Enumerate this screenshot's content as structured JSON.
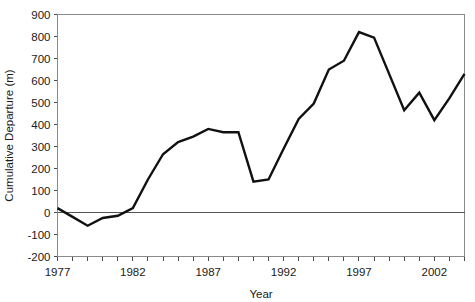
{
  "chart_data": {
    "type": "line",
    "title": "",
    "xlabel": "Year",
    "ylabel": "Cumulative Departure (m)",
    "xlim": [
      1977,
      2004
    ],
    "ylim": [
      -200,
      900
    ],
    "ytick_labels": [
      "900",
      "800",
      "700",
      "600",
      "500",
      "400",
      "300",
      "200",
      "100",
      "0",
      "-100",
      "-200"
    ],
    "ytick_values": [
      900,
      800,
      700,
      600,
      500,
      400,
      300,
      200,
      100,
      0,
      -100,
      -200
    ],
    "xtick_labels": [
      "1977",
      "1982",
      "1987",
      "1992",
      "1997",
      "2002"
    ],
    "xtick_values": [
      1977,
      1982,
      1987,
      1992,
      1997,
      2002
    ],
    "xtick_minor_step": 1,
    "grid": false,
    "legend": "none",
    "zero_reference_line": true,
    "series": [
      {
        "name": "Cumulative Departure",
        "x": [
          1977,
          1978,
          1979,
          1980,
          1981,
          1982,
          1983,
          1984,
          1985,
          1986,
          1987,
          1988,
          1989,
          1990,
          1991,
          1992,
          1993,
          1994,
          1995,
          1996,
          1997,
          1998,
          1999,
          2000,
          2001,
          2002,
          2003,
          2004
        ],
        "values": [
          20,
          -20,
          -60,
          -25,
          -15,
          20,
          150,
          265,
          320,
          345,
          380,
          365,
          365,
          140,
          150,
          290,
          425,
          495,
          650,
          690,
          820,
          795,
          630,
          465,
          545,
          420,
          520,
          630
        ]
      }
    ]
  },
  "colors": {
    "series": "#111111",
    "frame": "#8a8a8a",
    "zero_line": "#555555",
    "text": "#1a1a1a",
    "background": "#ffffff"
  }
}
